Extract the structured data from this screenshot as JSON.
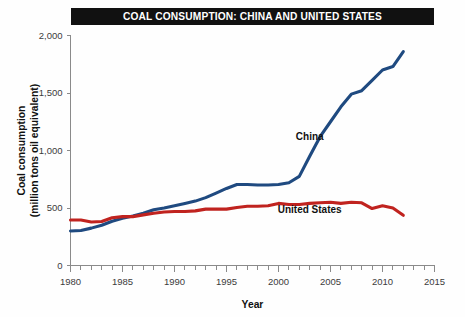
{
  "chart_data": {
    "type": "line",
    "title": "COAL CONSUMPTION: CHINA AND UNITED STATES",
    "xlabel": "Year",
    "ylabel": "Coal consumption\n(million tons oil equivalent)",
    "ylabel_line1": "Coal consumption",
    "ylabel_line2": "(million tons oil equivalent)",
    "xlim": [
      1980,
      2015
    ],
    "ylim": [
      0,
      2000
    ],
    "xticks": [
      1980,
      1985,
      1990,
      1995,
      2000,
      2005,
      2010,
      2015
    ],
    "xtick_labels": [
      "1980",
      "1985",
      "1990",
      "1995",
      "2000",
      "2005",
      "2010",
      "2015"
    ],
    "xminor_step": 1,
    "yticks": [
      0,
      500,
      1000,
      1500,
      2000
    ],
    "ytick_labels": [
      "0",
      "500",
      "1,000",
      "1,500",
      "2,000"
    ],
    "grid": false,
    "legend": "inline-annotations",
    "x": [
      1980,
      1981,
      1982,
      1983,
      1984,
      1985,
      1986,
      1987,
      1988,
      1989,
      1990,
      1991,
      1992,
      1993,
      1994,
      1995,
      1996,
      1997,
      1998,
      1999,
      2000,
      2001,
      2002,
      2003,
      2004,
      2005,
      2006,
      2007,
      2008,
      2009,
      2010,
      2011,
      2012
    ],
    "series": [
      {
        "name": "China",
        "color": "#1f4a80",
        "label_x": 2003,
        "label_y": 1090,
        "values": [
          300,
          305,
          325,
          350,
          385,
          410,
          430,
          455,
          485,
          500,
          520,
          540,
          560,
          590,
          630,
          670,
          705,
          705,
          700,
          700,
          705,
          720,
          775,
          950,
          1120,
          1250,
          1380,
          1490,
          1520,
          1610,
          1700,
          1730,
          1860
        ]
      },
      {
        "name": "United States",
        "color": "#c0231f",
        "label_x": 2003,
        "label_y": 455,
        "values": [
          395,
          395,
          378,
          382,
          415,
          425,
          425,
          440,
          455,
          465,
          470,
          470,
          475,
          490,
          490,
          490,
          505,
          515,
          515,
          520,
          540,
          530,
          530,
          540,
          545,
          550,
          540,
          550,
          545,
          495,
          520,
          500,
          437
        ]
      }
    ],
    "annotations": [
      {
        "text": "China",
        "series": "China"
      },
      {
        "text": "United States",
        "series": "United States"
      }
    ]
  }
}
